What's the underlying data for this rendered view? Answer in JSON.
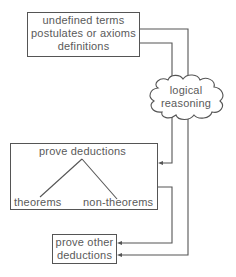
{
  "diagram": {
    "nodes": {
      "foundations": {
        "lines": [
          "undefined terms",
          "postulates or axioms",
          "definitions"
        ]
      },
      "reasoning": {
        "lines": [
          "logical",
          "reasoning"
        ]
      },
      "prove_deductions": {
        "title": "prove deductions",
        "branches": [
          "theorems",
          "non-theorems"
        ]
      },
      "prove_other": {
        "lines": [
          "prove other",
          "deductions"
        ]
      }
    },
    "edges": [
      {
        "from": "foundations",
        "to": "reasoning"
      },
      {
        "from": "reasoning",
        "to": "prove_deductions"
      },
      {
        "from": "reasoning",
        "to": "prove_other"
      },
      {
        "from": "prove_deductions",
        "to": "prove_other"
      },
      {
        "from": "prove_deductions",
        "to": "theorems"
      },
      {
        "from": "prove_deductions",
        "to": "non-theorems"
      }
    ],
    "line_color": "#555555"
  }
}
